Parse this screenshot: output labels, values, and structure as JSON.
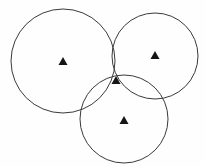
{
  "figure": {
    "type": "geometric-diagram",
    "canvas": {
      "width": 206,
      "height": 166,
      "background_color": "#fefefe"
    },
    "style": {
      "stroke_color": "#3a3a3a",
      "stroke_width": 1,
      "marker_color": "#151515",
      "marker_shape": "triangle-up"
    },
    "circles": [
      {
        "id": "circle-left",
        "label": "left circle",
        "cx": 63,
        "cy": 61,
        "r": 52,
        "stroke": "#3a3a3a",
        "stroke_width": 1
      },
      {
        "id": "circle-right",
        "label": "right circle",
        "cx": 155,
        "cy": 56,
        "r": 43,
        "stroke": "#3a3a3a",
        "stroke_width": 1
      },
      {
        "id": "circle-bottom",
        "label": "bottom circle",
        "cx": 124,
        "cy": 119,
        "r": 44,
        "stroke": "#3a3a3a",
        "stroke_width": 1
      }
    ],
    "markers": [
      {
        "id": "marker-center-left",
        "label": "center marker of left circle",
        "x": 63,
        "y": 61,
        "size": 9,
        "color": "#151515"
      },
      {
        "id": "marker-center-right",
        "label": "center marker of right circle",
        "x": 155,
        "y": 55,
        "size": 9,
        "color": "#151515"
      },
      {
        "id": "marker-center-bottom",
        "label": "center marker of bottom circle",
        "x": 124,
        "y": 120,
        "size": 9,
        "color": "#151515"
      },
      {
        "id": "marker-common-intersection",
        "label": "common intersection point of all three circles",
        "x": 116,
        "y": 80,
        "size": 9,
        "color": "#151515"
      }
    ]
  }
}
